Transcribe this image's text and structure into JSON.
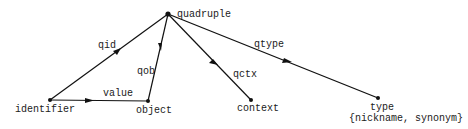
{
  "diagram": {
    "nodes": {
      "quadruple": {
        "label": "quadruple",
        "x": 168,
        "y": 14
      },
      "identifier": {
        "label": "identifier",
        "x": 50,
        "y": 100
      },
      "object": {
        "label": "object",
        "x": 148,
        "y": 101
      },
      "context": {
        "label": "context",
        "x": 251,
        "y": 100
      },
      "type": {
        "label": "type",
        "sublabel": "{nickname, synonym}",
        "x": 378,
        "y": 98
      }
    },
    "edges": {
      "qid": {
        "label": "qid",
        "from": "quadruple",
        "to": "identifier"
      },
      "qob": {
        "label": "qob",
        "from": "quadruple",
        "to": "object"
      },
      "qctx": {
        "label": "qctx",
        "from": "quadruple",
        "to": "context"
      },
      "qtype": {
        "label": "qtype",
        "from": "quadruple",
        "to": "type"
      },
      "value": {
        "label": "value",
        "from": "identifier",
        "to": "object"
      }
    },
    "line_color": "#111111"
  }
}
